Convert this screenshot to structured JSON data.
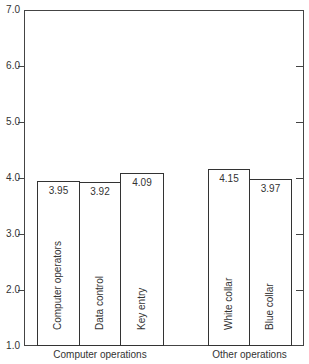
{
  "chart_data": {
    "type": "bar",
    "title": "",
    "xlabel": "",
    "ylabel": "",
    "ylim": [
      1.0,
      7.0
    ],
    "yticks": [
      "1.0",
      "2.0",
      "3.0",
      "4.0",
      "5.0",
      "6.0",
      "7.0"
    ],
    "grid": false,
    "legend": null,
    "groups": [
      {
        "label": "Computer operations",
        "bars": [
          {
            "label": "Computer  operators",
            "value": 3.95,
            "value_label": "3.95"
          },
          {
            "label": "Data control",
            "value": 3.92,
            "value_label": "3.92"
          },
          {
            "label": "Key entry",
            "value": 4.09,
            "value_label": "4.09"
          }
        ]
      },
      {
        "label": "Other operations",
        "bars": [
          {
            "label": "White collar",
            "value": 4.15,
            "value_label": "4.15"
          },
          {
            "label": "Blue collar",
            "value": 3.97,
            "value_label": "3.97"
          }
        ]
      }
    ],
    "categories": [
      "Computer  operators",
      "Data control",
      "Key entry",
      "White collar",
      "Blue collar"
    ],
    "values": [
      3.95,
      3.92,
      4.09,
      4.15,
      3.97
    ]
  }
}
